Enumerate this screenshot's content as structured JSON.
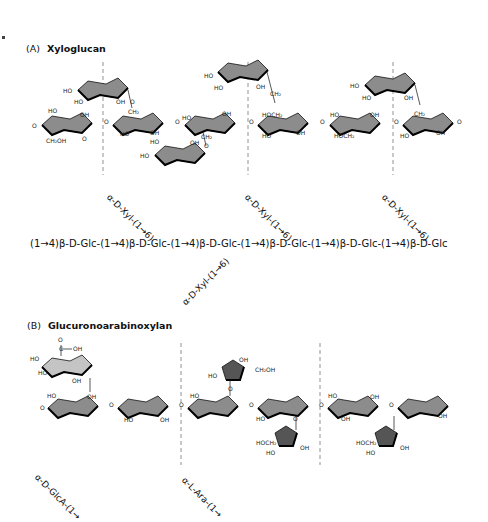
{
  "panel_a": {
    "letter": "(A)",
    "title": "Xyloglucan",
    "sequence": "(1→4)β-D-Glc-(1→4)β-D-Glc-(1→4)β-D-Glc-(1→4)β-D-Glc-(1→4)β-D-Glc-(1→4)β-D-Glc",
    "branches": [
      "α-D-Xyl-(1→6)",
      "α-D-Xyl-(1→6)",
      "α-D-Xyl-(1→6)",
      "α-D-Xyl-(1→6)"
    ]
  },
  "panel_b": {
    "letter": "(B)",
    "title": "Glucuronoarabinoxylan",
    "branches": [
      "α-D-GlcA-(1→",
      "α-L-Ara-(1→"
    ]
  },
  "colors": {
    "pyranose_fill": "#8c8c8c",
    "glucuronic_fill": "#c4c4c4",
    "furanose_fill": "#555555",
    "outline": "#111111",
    "divider": "#777777"
  },
  "atom_labels": {
    "ho": "HO",
    "oh": "OH",
    "o": "O",
    "ch2oh": "CH₂OH",
    "hoch2": "HOCH₂",
    "ch2": "CH₂",
    "cooh_c": "C",
    "cooh_o": "O"
  }
}
